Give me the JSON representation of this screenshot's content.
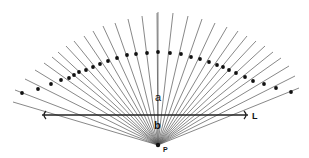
{
  "diagram": {
    "title": "",
    "labels": {
      "region_above_line": "a",
      "region_below_line": "b",
      "line": "L",
      "point": "P"
    },
    "point_P": {
      "x": 158,
      "y": 145
    },
    "line_L": {
      "x1": 42,
      "x2": 248,
      "y": 115,
      "arrows": "both"
    },
    "rays": [
      {
        "end": [
          13,
          102
        ],
        "dot": null
      },
      {
        "end": [
          15,
          90
        ],
        "dot": [
          22,
          93
        ]
      },
      {
        "end": [
          25,
          79
        ],
        "dot": [
          38,
          89
        ]
      },
      {
        "end": [
          35,
          70
        ],
        "dot": [
          51,
          84
        ]
      },
      {
        "end": [
          44,
          63
        ],
        "dot": [
          61,
          80
        ]
      },
      {
        "end": [
          52,
          57
        ],
        "dot": [
          69,
          78
        ]
      },
      {
        "end": [
          58,
          52
        ],
        "dot": [
          74,
          75
        ]
      },
      {
        "end": [
          66,
          46
        ],
        "dot": [
          79,
          72
        ]
      },
      {
        "end": [
          74,
          41
        ],
        "dot": [
          86,
          70
        ]
      },
      {
        "end": [
          84,
          36
        ],
        "dot": [
          93,
          67
        ]
      },
      {
        "end": [
          93,
          31
        ],
        "dot": [
          100,
          64
        ]
      },
      {
        "end": [
          103,
          26
        ],
        "dot": [
          108,
          61
        ]
      },
      {
        "end": [
          115,
          23
        ],
        "dot": [
          117,
          58
        ]
      },
      {
        "end": [
          128,
          19
        ],
        "dot": [
          127,
          55
        ]
      },
      {
        "end": [
          142,
          16
        ],
        "dot": [
          136,
          54
        ]
      },
      {
        "end": [
          157,
          13
        ],
        "dot": [
          147,
          53
        ]
      },
      {
        "end": [
          158,
          12
        ],
        "dot": [
          158,
          52
        ]
      },
      {
        "end": [
          173,
          13
        ],
        "dot": [
          170,
          53
        ]
      },
      {
        "end": [
          188,
          16
        ],
        "dot": [
          181,
          54
        ]
      },
      {
        "end": [
          202,
          19
        ],
        "dot": [
          191,
          57
        ]
      },
      {
        "end": [
          215,
          23
        ],
        "dot": [
          200,
          59
        ]
      },
      {
        "end": [
          227,
          27
        ],
        "dot": [
          209,
          62
        ]
      },
      {
        "end": [
          238,
          31
        ],
        "dot": [
          217,
          65
        ]
      },
      {
        "end": [
          247,
          36
        ],
        "dot": [
          223,
          67
        ]
      },
      {
        "end": [
          256,
          41
        ],
        "dot": [
          229,
          70
        ]
      },
      {
        "end": [
          265,
          46
        ],
        "dot": [
          236,
          73
        ]
      },
      {
        "end": [
          273,
          52
        ],
        "dot": [
          245,
          77
        ]
      },
      {
        "end": [
          281,
          58
        ],
        "dot": [
          253,
          81
        ]
      },
      {
        "end": [
          289,
          66
        ],
        "dot": [
          264,
          84
        ]
      },
      {
        "end": [
          295,
          76
        ],
        "dot": [
          276,
          88
        ]
      },
      {
        "end": [
          299,
          88
        ],
        "dot": [
          291,
          92
        ]
      }
    ],
    "colors": {
      "ray": "#555555",
      "dot": "#111111",
      "line": "#222222",
      "background": "#ffffff"
    }
  }
}
